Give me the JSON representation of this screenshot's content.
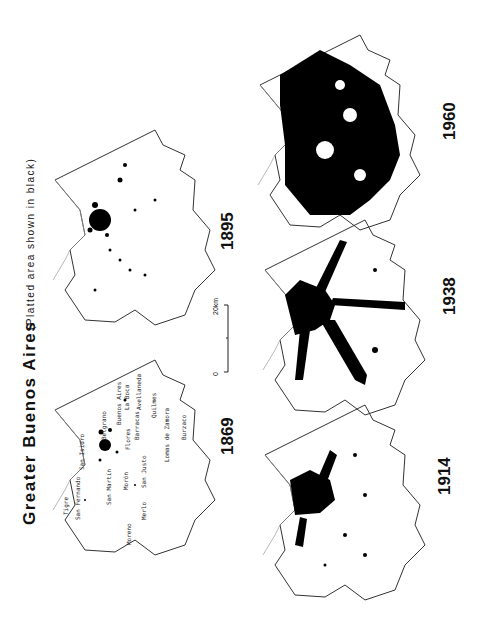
{
  "title": "Greater Buenos Aires",
  "subtitle": "(Platted area shown in black)",
  "scale": {
    "start": "0",
    "end": "20km"
  },
  "maps": [
    {
      "year": "1869"
    },
    {
      "year": "1895"
    },
    {
      "year": "1914"
    },
    {
      "year": "1938"
    },
    {
      "year": "1960"
    }
  ],
  "places_1869": [
    {
      "name": "Tigre"
    },
    {
      "name": "San Fernando"
    },
    {
      "name": "San Isidro"
    },
    {
      "name": "Belgrano"
    },
    {
      "name": "Buenos Aires"
    },
    {
      "name": "La Boca"
    },
    {
      "name": "Barracas"
    },
    {
      "name": "Avellaneda"
    },
    {
      "name": "Quilmes"
    },
    {
      "name": "Flores"
    },
    {
      "name": "San Martín"
    },
    {
      "name": "Morón"
    },
    {
      "name": "San Justo"
    },
    {
      "name": "Lomas de Zamora"
    },
    {
      "name": "Burzaco"
    },
    {
      "name": "Merlo"
    },
    {
      "name": "Moreno"
    }
  ],
  "colors": {
    "platted": "#000000",
    "boundary": "#333333",
    "river": "#888888",
    "background": "#ffffff"
  }
}
